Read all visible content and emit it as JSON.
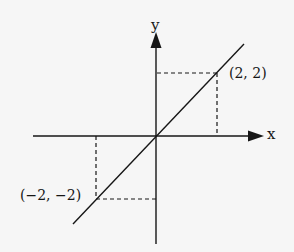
{
  "diagram": {
    "title": "",
    "type": "coordinate-plane",
    "axes": {
      "x_label": "x",
      "y_label": "y"
    },
    "line": {
      "equation": "y = x",
      "description": "straight line through origin with slope 1"
    },
    "points": [
      {
        "label": "(2, 2)",
        "x": 2,
        "y": 2
      },
      {
        "label": "(−2, −2)",
        "x": -2,
        "y": -2
      }
    ],
    "guides": "dashed projection lines from each point to both axes",
    "colors": {
      "background": "#f6f6f6",
      "ink": "#161616"
    }
  }
}
